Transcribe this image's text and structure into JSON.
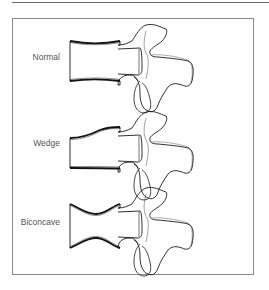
{
  "figure": {
    "type": "vertebral-body-shape-diagram",
    "colors": {
      "outline": "#1a1a1a",
      "endplate": "#111111",
      "frame": "#8a8a8a",
      "label": "#555555"
    },
    "panels": [
      {
        "label": "Normal",
        "shape": "normal"
      },
      {
        "label": "Wedge",
        "shape": "wedge"
      },
      {
        "label": "Biconcave",
        "shape": "biconcave"
      }
    ]
  }
}
